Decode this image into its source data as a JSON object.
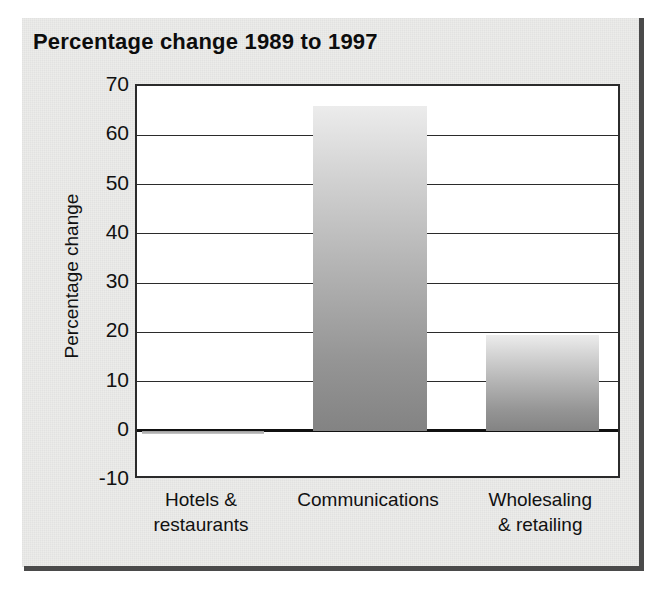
{
  "chart_data": {
    "type": "bar",
    "title": "Percentage change 1989 to 1997",
    "xlabel": "",
    "ylabel": "Percentage change",
    "categories": [
      "Hotels & restaurants",
      "Communications",
      "Wholesaling & retailing"
    ],
    "category_lines": [
      [
        "Hotels &",
        "restaurants"
      ],
      [
        "Communications",
        ""
      ],
      [
        "Wholesaling",
        "& retailing"
      ]
    ],
    "values": [
      -0.5,
      66,
      19.5
    ],
    "ylim": [
      -10,
      70
    ],
    "ytick_labels": [
      "70",
      "60",
      "50",
      "40",
      "30",
      "20",
      "10",
      "0",
      "-10"
    ],
    "ytick_values": [
      70,
      60,
      50,
      40,
      30,
      20,
      10,
      0,
      -10
    ],
    "grid": true,
    "legend": "none",
    "bar_fill": "grey-vertical-gradient",
    "bar_color_top": "#ececec",
    "bar_color_bottom": "#838383",
    "axis_color": "#2b2b2b",
    "background_color": "#ececea",
    "title_color": "#0d0d0d"
  }
}
